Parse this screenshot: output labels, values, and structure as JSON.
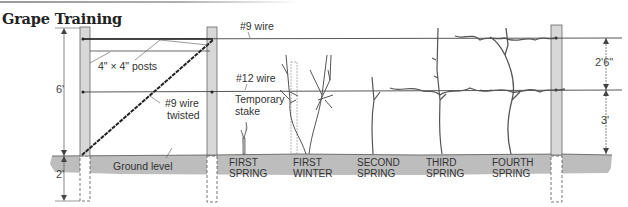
{
  "title": "Grape Training",
  "labels": {
    "wire_top": "#9 wire",
    "wire_mid": "#12 wire",
    "posts": "4\" × 4\" posts",
    "twisted_line1": "#9 wire",
    "twisted_line2": "twisted",
    "stake_line1": "Temporary",
    "stake_line2": "stake",
    "ground": "Ground level"
  },
  "dimensions": {
    "height_total": "6'",
    "depth": "2'",
    "upper_gap": "2'6\"",
    "lower_gap": "3'"
  },
  "stages": [
    {
      "line1": "FIRST",
      "line2": "SPRING"
    },
    {
      "line1": "FIRST",
      "line2": "WINTER"
    },
    {
      "line1": "SECOND",
      "line2": "SPRING"
    },
    {
      "line1": "THIRD",
      "line2": "SPRING"
    },
    {
      "line1": "FOURTH",
      "line2": "SPRING"
    }
  ],
  "colors": {
    "ground": "#bdbdbd",
    "post": "#d8d8d8",
    "vine": "#c9c9c9",
    "line": "#333333"
  }
}
